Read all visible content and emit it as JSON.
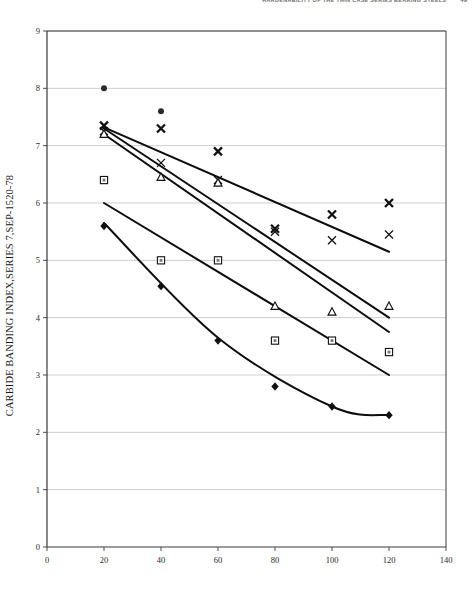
{
  "header": {
    "running_title": "HARDENABILITY OF THE THIN CASE SERIES BEARING STEELS",
    "page_number": "49"
  },
  "axes": {
    "y_title": "CARBIDE BANDING INDEX,SERIES 7,SEP-1520-78",
    "x_title": ""
  },
  "chart_data": {
    "type": "scatter",
    "title": "",
    "subtitle": "",
    "xlabel": "",
    "ylabel": "CARBIDE BANDING INDEX,SERIES 7,SEP-1520-78",
    "xlim": [
      0,
      140
    ],
    "ylim": [
      0,
      9
    ],
    "xticks": [
      0,
      20,
      40,
      60,
      80,
      100,
      120,
      140
    ],
    "yticks": [
      0,
      1,
      2,
      3,
      4,
      5,
      6,
      7,
      8,
      9
    ],
    "grid": "horizontal",
    "legend": "none",
    "annotations": [],
    "series": [
      {
        "name": "series-1",
        "marker": "filled-circle",
        "fit": "line",
        "x": [
          20,
          40
        ],
        "y": [
          8.0,
          7.6
        ]
      },
      {
        "name": "series-2",
        "marker": "x-bold",
        "fit": "line",
        "x": [
          20,
          40,
          60,
          80,
          100,
          120
        ],
        "y": [
          7.35,
          7.3,
          6.9,
          5.55,
          5.8,
          6.0
        ],
        "trend": [
          [
            20,
            7.32
          ],
          [
            120,
            5.15
          ]
        ]
      },
      {
        "name": "series-3",
        "marker": "x-thin",
        "fit": "line",
        "x": [
          20,
          40,
          60,
          80,
          100,
          120
        ],
        "y": [
          7.25,
          6.7,
          6.4,
          5.5,
          5.35,
          5.45
        ],
        "trend": [
          [
            20,
            7.3
          ],
          [
            120,
            4.0
          ]
        ]
      },
      {
        "name": "series-4",
        "marker": "open-triangle",
        "fit": "line",
        "x": [
          20,
          40,
          60,
          80,
          100,
          120
        ],
        "y": [
          7.2,
          6.45,
          6.35,
          4.2,
          4.1,
          4.2
        ],
        "trend": [
          [
            20,
            7.2
          ],
          [
            120,
            3.75
          ]
        ]
      },
      {
        "name": "series-5",
        "marker": "open-square",
        "fit": "line",
        "x": [
          20,
          40,
          60,
          80,
          100,
          120
        ],
        "y": [
          6.4,
          5.0,
          5.0,
          3.6,
          3.6,
          3.4
        ],
        "trend": [
          [
            20,
            6.0
          ],
          [
            120,
            3.0
          ]
        ]
      },
      {
        "name": "series-6",
        "marker": "filled-diamond",
        "fit": "curve",
        "x": [
          20,
          40,
          60,
          80,
          100,
          120
        ],
        "y": [
          5.6,
          4.55,
          3.6,
          2.8,
          2.45,
          2.3
        ],
        "trend": [
          [
            20,
            5.65
          ],
          [
            60,
            3.65
          ],
          [
            100,
            2.45
          ],
          [
            120,
            2.3
          ]
        ]
      }
    ]
  }
}
